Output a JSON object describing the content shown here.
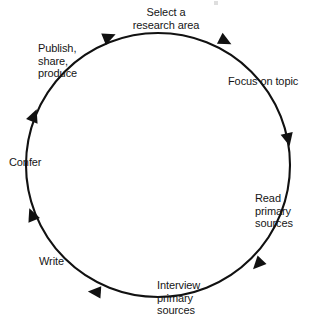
{
  "diagram": {
    "type": "cycle",
    "direction": "clockwise",
    "line_color": "#111111",
    "text_color": "#161616",
    "background_color": "#ffffff",
    "circle": {
      "center_x": 158,
      "center_y": 165,
      "radius": 132
    },
    "stages": [
      {
        "id": "select-research-area",
        "label": "Select a\nresearch area",
        "order": 1,
        "angle_deg": 270,
        "arrow_angle_deg": 248
      },
      {
        "id": "focus-on-topic",
        "label": "Focus on topic",
        "order": 2,
        "angle_deg": 315,
        "arrow_angle_deg": 297
      },
      {
        "id": "read-primary-sources",
        "label": "Read\nprimary\nsources",
        "order": 3,
        "angle_deg": 0,
        "arrow_angle_deg": 347
      },
      {
        "id": "interview-primary-sources",
        "label": "Interview\nprimary\nsources",
        "order": 4,
        "angle_deg": 60,
        "arrow_angle_deg": 44
      },
      {
        "id": "write",
        "label": "Write",
        "order": 5,
        "angle_deg": 120,
        "arrow_angle_deg": 94
      },
      {
        "id": "confer",
        "label": "Confer",
        "order": 6,
        "angle_deg": 180,
        "arrow_angle_deg": 158
      },
      {
        "id": "publish-share-produce",
        "label": "Publish,\nshare,\nproduce",
        "order": 7,
        "angle_deg": 215,
        "arrow_angle_deg": 202
      }
    ],
    "arrowheads": [
      {
        "id": "arrow-1",
        "angle_deg": 202,
        "x": 34,
        "y": 116
      },
      {
        "id": "arrow-2",
        "angle_deg": 248,
        "x": 109,
        "y": 37
      },
      {
        "id": "arrow-3",
        "angle_deg": 297,
        "x": 225,
        "y": 41
      },
      {
        "id": "arrow-4",
        "angle_deg": 347,
        "x": 288,
        "y": 139
      },
      {
        "id": "arrow-5",
        "angle_deg": 44,
        "x": 258,
        "y": 264
      },
      {
        "id": "arrow-6",
        "angle_deg": 94,
        "x": 95,
        "y": 292
      },
      {
        "id": "arrow-7",
        "angle_deg": 158,
        "x": 32,
        "y": 215
      }
    ]
  }
}
